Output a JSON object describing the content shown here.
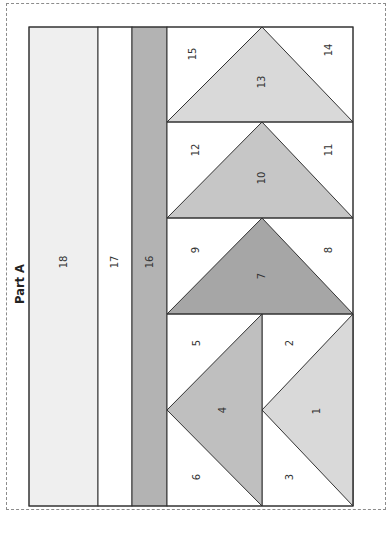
{
  "title": "Part A",
  "colors": {
    "dashed_border": "#8c8c8c",
    "outline": "#333333",
    "very_light_gray": "#efefef",
    "white": "#ffffff",
    "medium_gray": "#b3b3b3",
    "light_gray": "#d9d9d9",
    "gray_10": "#c6c6c6",
    "dark_gray_7": "#a6a6a6",
    "gray_4": "#bfbfbf"
  },
  "pieces": {
    "p1": "1",
    "p2": "2",
    "p3": "3",
    "p4": "4",
    "p5": "5",
    "p6": "6",
    "p7": "7",
    "p8": "8",
    "p9": "9",
    "p10": "10",
    "p11": "11",
    "p12": "12",
    "p13": "13",
    "p14": "14",
    "p15": "15",
    "p16": "16",
    "p17": "17",
    "p18": "18"
  }
}
